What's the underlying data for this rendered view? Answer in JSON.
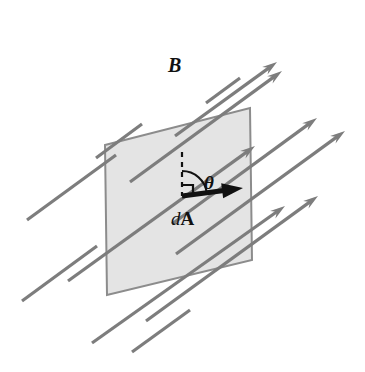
{
  "figure": {
    "background_color": "#ffffff"
  },
  "surface": {
    "name": "area-element-parallelogram",
    "fill_color": "#e4e4e4",
    "stroke_color": "#8c8c8c",
    "stroke_width": 2,
    "points": "105,145 250,108 252,260 107,295"
  },
  "field": {
    "label": "B",
    "line_color": "#7d7d7d",
    "line_width": 3.2,
    "arrow_angle_degrees": -35,
    "lines": [
      {
        "x1": 68,
        "y1": 281,
        "x2": 255,
        "y2": 146,
        "arrow": true
      },
      {
        "x1": 92,
        "y1": 343,
        "x2": 285,
        "y2": 206,
        "arrow": true
      },
      {
        "x1": 146,
        "y1": 321,
        "x2": 318,
        "y2": 196,
        "arrow": true
      },
      {
        "x1": 176,
        "y1": 254,
        "x2": 345,
        "y2": 131,
        "arrow": true
      },
      {
        "x1": 130,
        "y1": 182,
        "x2": 282,
        "y2": 71,
        "arrow": true
      },
      {
        "x1": 175,
        "y1": 136,
        "x2": 277,
        "y2": 62,
        "arrow": true
      },
      {
        "x1": 172,
        "y1": 224,
        "x2": 317,
        "y2": 118,
        "arrow": true
      },
      {
        "x1": 27,
        "y1": 220,
        "x2": 116,
        "y2": 155,
        "arrow": false
      },
      {
        "x1": 96,
        "y1": 158,
        "x2": 142,
        "y2": 124,
        "arrow": false
      },
      {
        "x1": 206,
        "y1": 103,
        "x2": 240,
        "y2": 78,
        "arrow": false
      },
      {
        "x1": 132,
        "y1": 352,
        "x2": 190,
        "y2": 310,
        "arrow": false
      },
      {
        "x1": 22,
        "y1": 301,
        "x2": 97,
        "y2": 246,
        "arrow": false
      }
    ]
  },
  "normal": {
    "name": "dashed-normal-line",
    "color": "#111111",
    "x": 182,
    "y_top": 152,
    "y_bottom": 196,
    "dash_pattern": "5,5"
  },
  "right_angle": {
    "name": "right-angle-marker",
    "color": "#111111",
    "size": 11,
    "corner_x": 182,
    "corner_y": 196
  },
  "angle_arc": {
    "name": "theta-arc",
    "color": "#111111",
    "radius": 25,
    "center_x": 182,
    "center_y": 196
  },
  "da_vector": {
    "label_d": "d",
    "label_A": "A",
    "color": "#111111",
    "x1": 182,
    "y1": 196,
    "x2": 243,
    "y2": 188,
    "shaft_width": 5
  },
  "labels": {
    "field_label": "B",
    "angle_label": "θ",
    "area_label_italic": "d",
    "area_label_bold": "A",
    "field_label_x": 168,
    "field_label_y": 72,
    "angle_label_x": 204,
    "angle_label_y": 189,
    "area_label_x": 171,
    "area_label_y": 225
  }
}
